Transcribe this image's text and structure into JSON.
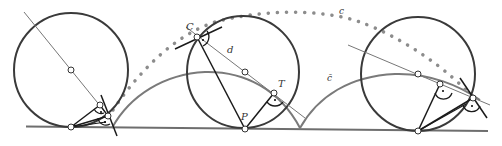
{
  "figure": {
    "labels": {
      "C": "C",
      "d": "d",
      "T": "T",
      "P": "P",
      "c": "c",
      "c_bar": "c̄"
    },
    "colors": {
      "circle": "#3a3a3a",
      "base_line": "#6e6e6e",
      "cycloid": "#7a7a7a",
      "dotted_curve": "#8c8c8c",
      "construction": "#1a1a1a",
      "thin_line": "#777777"
    }
  }
}
